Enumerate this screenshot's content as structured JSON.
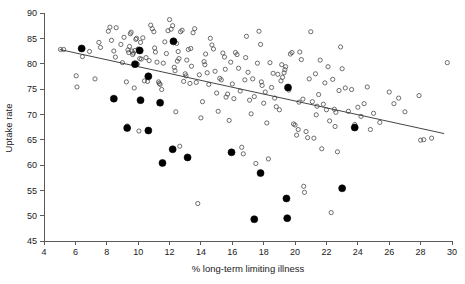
{
  "chart_data": {
    "type": "scatter",
    "title": "",
    "subtitle": "",
    "xlabel": "% long-term limiting illness",
    "ylabel": "Uptake rate",
    "xlim": [
      4,
      30
    ],
    "ylim": [
      45,
      90
    ],
    "xticks": [
      4,
      6,
      8,
      10,
      12,
      14,
      16,
      18,
      20,
      22,
      24,
      26,
      28,
      30
    ],
    "yticks": [
      45,
      50,
      55,
      60,
      65,
      70,
      75,
      80,
      85,
      90
    ],
    "xtick_labels": [
      "4",
      "6",
      "8",
      "10",
      "12",
      "14",
      "16",
      "18",
      "20",
      "22",
      "24",
      "26",
      "28",
      "30"
    ],
    "ytick_labels": [
      "45",
      "50",
      "55",
      "60",
      "65",
      "70",
      "75",
      "80",
      "85",
      "90"
    ],
    "grid": false,
    "legend": null,
    "legend_position": "none",
    "annotations": [],
    "colors": {
      "open_marker_stroke": "#4a4a4a",
      "filled_marker": "#000000",
      "trend_line": "#303030",
      "axis": "#5a5a5a",
      "text": "#1a1a1a",
      "background": "#ffffff"
    },
    "trend_line": {
      "x": [
        5.0,
        29.5
      ],
      "y": [
        82.8,
        66.2
      ]
    },
    "series": [
      {
        "name": "open-circles",
        "marker": "open-circle",
        "marker_radius": 2.1,
        "points": [
          [
            5.05,
            82.8
          ],
          [
            5.25,
            82.8
          ],
          [
            6.05,
            77.6
          ],
          [
            6.1,
            75.4
          ],
          [
            6.45,
            81.4
          ],
          [
            6.9,
            82.4
          ],
          [
            7.25,
            77.0
          ],
          [
            7.5,
            84.2
          ],
          [
            8.1,
            86.4
          ],
          [
            8.2,
            87.2
          ],
          [
            8.45,
            82.5
          ],
          [
            8.55,
            81.3
          ],
          [
            8.6,
            87.1
          ],
          [
            8.9,
            83.8
          ],
          [
            9.0,
            80.2
          ],
          [
            9.1,
            85.2
          ],
          [
            9.25,
            76.4
          ],
          [
            9.3,
            67.7
          ],
          [
            9.35,
            82.7
          ],
          [
            9.4,
            82.2
          ],
          [
            9.5,
            85.9
          ],
          [
            9.55,
            86.2
          ],
          [
            9.6,
            82.5
          ],
          [
            9.65,
            81.8
          ],
          [
            9.7,
            82.1
          ],
          [
            9.75,
            75.2
          ],
          [
            9.8,
            82.6
          ],
          [
            9.85,
            84.8
          ],
          [
            9.9,
            85.0
          ],
          [
            9.95,
            79.9
          ],
          [
            10.0,
            82.9
          ],
          [
            10.05,
            66.7
          ],
          [
            10.1,
            81.0
          ],
          [
            10.2,
            80.9
          ],
          [
            10.3,
            85.1
          ],
          [
            10.4,
            76.6
          ],
          [
            10.5,
            81.2
          ],
          [
            10.6,
            76.5
          ],
          [
            10.7,
            80.6
          ],
          [
            10.8,
            87.6
          ],
          [
            10.9,
            86.9
          ],
          [
            11.0,
            86.3
          ],
          [
            11.1,
            82.3
          ],
          [
            11.2,
            80.3
          ],
          [
            11.3,
            76.4
          ],
          [
            11.35,
            76.1
          ],
          [
            11.4,
            75.9
          ],
          [
            11.5,
            74.9
          ],
          [
            11.6,
            80.1
          ],
          [
            11.7,
            84.3
          ],
          [
            11.8,
            82.0
          ],
          [
            11.9,
            86.5
          ],
          [
            12.0,
            88.7
          ],
          [
            12.1,
            86.8
          ],
          [
            12.2,
            87.5
          ],
          [
            12.3,
            79.3
          ],
          [
            12.35,
            78.6
          ],
          [
            12.4,
            70.5
          ],
          [
            12.5,
            80.5
          ],
          [
            12.55,
            82.4
          ],
          [
            12.6,
            81.0
          ],
          [
            12.65,
            63.7
          ],
          [
            12.7,
            86.3
          ],
          [
            12.8,
            86.6
          ],
          [
            12.9,
            76.5
          ],
          [
            13.0,
            78.0
          ],
          [
            13.05,
            77.6
          ],
          [
            13.1,
            80.7
          ],
          [
            13.2,
            82.8
          ],
          [
            13.3,
            76.1
          ],
          [
            13.4,
            79.5
          ],
          [
            13.5,
            86.1
          ],
          [
            13.6,
            86.9
          ],
          [
            13.7,
            76.3
          ],
          [
            13.8,
            52.4
          ],
          [
            13.9,
            77.8
          ],
          [
            14.0,
            69.3
          ],
          [
            14.1,
            72.5
          ],
          [
            14.2,
            80.4
          ],
          [
            14.3,
            81.9
          ],
          [
            14.4,
            78.2
          ],
          [
            14.5,
            75.9
          ],
          [
            14.6,
            85.0
          ],
          [
            14.7,
            83.7
          ],
          [
            14.8,
            82.9
          ],
          [
            14.9,
            78.5
          ],
          [
            15.0,
            74.2
          ],
          [
            15.1,
            70.6
          ],
          [
            15.2,
            77.1
          ],
          [
            15.3,
            76.8
          ],
          [
            15.4,
            82.1
          ],
          [
            15.5,
            81.3
          ],
          [
            15.6,
            73.4
          ],
          [
            15.7,
            74.0
          ],
          [
            15.8,
            68.8
          ],
          [
            15.9,
            80.3
          ],
          [
            16.0,
            76.0
          ],
          [
            16.1,
            73.1
          ],
          [
            16.2,
            82.2
          ],
          [
            16.3,
            81.8
          ],
          [
            16.4,
            79.1
          ],
          [
            16.5,
            74.6
          ],
          [
            16.6,
            63.5
          ],
          [
            16.7,
            62.2
          ],
          [
            16.8,
            76.8
          ],
          [
            16.9,
            85.4
          ],
          [
            17.0,
            78.3
          ],
          [
            17.1,
            72.8
          ],
          [
            17.2,
            70.1
          ],
          [
            17.3,
            77.0
          ],
          [
            17.4,
            73.5
          ],
          [
            17.5,
            60.3
          ],
          [
            17.6,
            80.1
          ],
          [
            17.7,
            86.4
          ],
          [
            17.8,
            83.8
          ],
          [
            17.9,
            75.7
          ],
          [
            18.0,
            72.2
          ],
          [
            18.1,
            74.4
          ],
          [
            18.2,
            68.3
          ],
          [
            18.3,
            61.2
          ],
          [
            18.4,
            80.2
          ],
          [
            18.5,
            75.3
          ],
          [
            18.6,
            78.1
          ],
          [
            18.7,
            73.2
          ],
          [
            18.8,
            71.5
          ],
          [
            18.9,
            77.9
          ],
          [
            19.0,
            70.9
          ],
          [
            19.1,
            76.6
          ],
          [
            19.2,
            77.3
          ],
          [
            19.3,
            78.2
          ],
          [
            19.35,
            78.8
          ],
          [
            19.4,
            79.4
          ],
          [
            19.5,
            75.1
          ],
          [
            19.6,
            74.8
          ],
          [
            19.7,
            81.9
          ],
          [
            19.8,
            82.2
          ],
          [
            19.9,
            68.1
          ],
          [
            20.0,
            67.9
          ],
          [
            20.1,
            65.9
          ],
          [
            20.2,
            67.0
          ],
          [
            20.3,
            82.3
          ],
          [
            20.4,
            80.8
          ],
          [
            20.5,
            73.0
          ],
          [
            20.55,
            55.8
          ],
          [
            20.6,
            54.6
          ],
          [
            20.7,
            66.6
          ],
          [
            20.8,
            65.4
          ],
          [
            20.9,
            77.0
          ],
          [
            21.0,
            86.3
          ],
          [
            21.1,
            72.5
          ],
          [
            21.2,
            65.3
          ],
          [
            21.3,
            78.0
          ],
          [
            21.4,
            71.6
          ],
          [
            21.5,
            73.9
          ],
          [
            21.6,
            80.7
          ],
          [
            21.7,
            63.2
          ],
          [
            21.8,
            72.0
          ],
          [
            21.9,
            76.2
          ],
          [
            22.0,
            70.9
          ],
          [
            22.1,
            79.4
          ],
          [
            22.2,
            68.7
          ],
          [
            22.3,
            50.6
          ],
          [
            22.4,
            76.9
          ],
          [
            22.5,
            71.0
          ],
          [
            22.6,
            70.4
          ],
          [
            22.7,
            62.6
          ],
          [
            22.8,
            74.7
          ],
          [
            22.9,
            83.3
          ],
          [
            23.0,
            79.0
          ],
          [
            23.2,
            75.2
          ],
          [
            23.4,
            70.6
          ],
          [
            23.6,
            74.9
          ],
          [
            23.8,
            68.0
          ],
          [
            24.0,
            71.4
          ],
          [
            24.2,
            69.6
          ],
          [
            24.4,
            72.1
          ],
          [
            24.6,
            75.4
          ],
          [
            24.8,
            67.0
          ],
          [
            25.0,
            70.2
          ],
          [
            25.4,
            68.4
          ],
          [
            26.0,
            74.4
          ],
          [
            26.3,
            72.1
          ],
          [
            26.6,
            73.2
          ],
          [
            27.0,
            70.5
          ],
          [
            27.9,
            73.7
          ],
          [
            28.0,
            64.9
          ],
          [
            28.2,
            65.0
          ],
          [
            28.7,
            65.3
          ],
          [
            29.7,
            80.2
          ],
          [
            7.6,
            83.2
          ],
          [
            8.3,
            84.6
          ],
          [
            9.45,
            83.4
          ],
          [
            10.15,
            84.2
          ],
          [
            11.05,
            83.1
          ],
          [
            12.45,
            84.0
          ],
          [
            13.35,
            83.0
          ],
          [
            14.25,
            79.8
          ],
          [
            15.55,
            78.9
          ],
          [
            16.85,
            81.2
          ],
          [
            17.85,
            76.4
          ],
          [
            19.15,
            79.8
          ],
          [
            20.25,
            72.4
          ],
          [
            21.35,
            69.9
          ],
          [
            22.55,
            67.6
          ]
        ]
      },
      {
        "name": "filled-circles",
        "marker": "filled-circle",
        "marker_radius": 3.5,
        "points": [
          [
            6.4,
            83.0
          ],
          [
            8.45,
            73.1
          ],
          [
            9.3,
            67.3
          ],
          [
            9.8,
            79.9
          ],
          [
            10.1,
            82.6
          ],
          [
            10.15,
            72.8
          ],
          [
            10.65,
            66.8
          ],
          [
            10.65,
            77.5
          ],
          [
            11.4,
            72.3
          ],
          [
            11.55,
            60.4
          ],
          [
            12.2,
            63.1
          ],
          [
            12.25,
            84.4
          ],
          [
            13.15,
            61.5
          ],
          [
            15.95,
            62.5
          ],
          [
            17.4,
            49.3
          ],
          [
            17.8,
            58.4
          ],
          [
            19.45,
            53.4
          ],
          [
            19.5,
            49.5
          ],
          [
            19.55,
            75.3
          ],
          [
            23.0,
            55.4
          ],
          [
            23.8,
            67.4
          ]
        ]
      }
    ]
  }
}
